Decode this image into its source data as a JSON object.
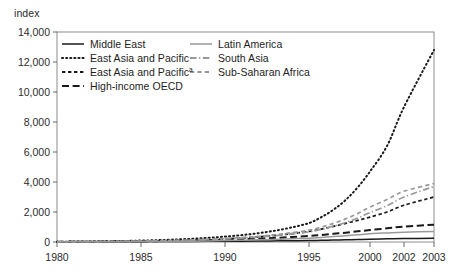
{
  "figure": {
    "background_color": "#ffffff",
    "frame_color": "#808080",
    "text_color": "#2b2b2b"
  },
  "axis": {
    "unit_label": "index"
  },
  "chart_data": {
    "type": "line",
    "title": "",
    "subtitle": "",
    "xlabel": "",
    "ylabel": "index",
    "xlim": [
      1980,
      2003
    ],
    "ylim": [
      0,
      14000
    ],
    "grid": false,
    "legend_position": "inside-top-left",
    "x_tick_labels": [
      "1980",
      "1985",
      "1990",
      "1995",
      "2000",
      "2002",
      "2003"
    ],
    "x_tick_values": [
      1980,
      1985,
      1990,
      1995,
      2000,
      2002,
      2003
    ],
    "y_tick_labels": [
      "0",
      "2,000",
      "4,000",
      "6,000",
      "8,000",
      "10,000",
      "12,000",
      "14,000"
    ],
    "y_tick_values": [
      0,
      2000,
      4000,
      6000,
      8000,
      10000,
      12000,
      14000
    ],
    "x": [
      1980,
      1981,
      1982,
      1983,
      1984,
      1985,
      1986,
      1987,
      1988,
      1989,
      1990,
      1991,
      1992,
      1993,
      1994,
      1995,
      1996,
      1997,
      1998,
      1999,
      2000,
      2001,
      2002,
      2003
    ],
    "series": [
      {
        "name": "Middle East",
        "style": "solid",
        "color": "#1a1a1a",
        "width": 1.5,
        "values": [
          10,
          12,
          14,
          17,
          20,
          24,
          28,
          33,
          38,
          44,
          50,
          58,
          66,
          76,
          86,
          98,
          112,
          128,
          146,
          166,
          190,
          210,
          230,
          250
        ]
      },
      {
        "name": "East Asia and Pacific",
        "style": "dotted",
        "color": "#1a1a1a",
        "width": 2.0,
        "values": [
          20,
          28,
          38,
          52,
          70,
          95,
          125,
          165,
          215,
          280,
          360,
          460,
          590,
          760,
          980,
          1260,
          1650,
          2150,
          2800,
          3650,
          4700,
          6400,
          9000,
          12800
        ]
      },
      {
        "name": "East Asia and Pacific",
        "name_suffix": "a",
        "style": "short-dash",
        "color": "#1a1a1a",
        "width": 1.7,
        "values": [
          15,
          20,
          26,
          34,
          45,
          58,
          75,
          98,
          126,
          162,
          208,
          268,
          345,
          440,
          560,
          700,
          860,
          1040,
          1240,
          1440,
          1660,
          2000,
          2450,
          3000
        ]
      },
      {
        "name": "High-income OECD",
        "style": "long-dash",
        "color": "#1a1a1a",
        "width": 2.0,
        "values": [
          12,
          16,
          21,
          27,
          35,
          45,
          58,
          74,
          94,
          118,
          148,
          184,
          226,
          276,
          334,
          400,
          470,
          545,
          625,
          710,
          800,
          910,
          1030,
          1150
        ]
      },
      {
        "name": "Latin America",
        "style": "solid",
        "color": "#999999",
        "width": 1.5,
        "values": [
          8,
          10,
          13,
          17,
          22,
          28,
          36,
          46,
          58,
          73,
          92,
          115,
          142,
          175,
          212,
          255,
          305,
          360,
          420,
          485,
          550,
          605,
          655,
          700
        ]
      },
      {
        "name": "South Asia",
        "style": "dash-dot",
        "color": "#999999",
        "width": 1.7,
        "values": [
          14,
          19,
          25,
          33,
          44,
          57,
          74,
          96,
          124,
          160,
          205,
          262,
          334,
          424,
          536,
          675,
          845,
          1050,
          1300,
          1600,
          1960,
          2420,
          3000,
          3700
        ]
      },
      {
        "name": "Sub-Saharan Africa",
        "style": "dashed",
        "color": "#999999",
        "width": 1.7,
        "values": [
          16,
          21,
          28,
          37,
          49,
          64,
          84,
          109,
          141,
          182,
          234,
          300,
          384,
          490,
          622,
          788,
          990,
          1240,
          1540,
          1900,
          2330,
          2830,
          3380,
          3900
        ]
      }
    ]
  },
  "legend": {
    "entries": [
      {
        "label": "Middle East",
        "suffix": "",
        "style": "solid",
        "color": "#1a1a1a",
        "column": 0,
        "row": 0
      },
      {
        "label": "East Asia and Pacific",
        "suffix": "",
        "style": "dotted",
        "color": "#1a1a1a",
        "column": 0,
        "row": 1
      },
      {
        "label": "East Asia and Pacific",
        "suffix": "a",
        "style": "short-dash",
        "color": "#1a1a1a",
        "column": 0,
        "row": 2
      },
      {
        "label": "High-income OECD",
        "suffix": "",
        "style": "long-dash",
        "color": "#1a1a1a",
        "column": 0,
        "row": 3
      },
      {
        "label": "Latin America",
        "suffix": "",
        "style": "solid",
        "color": "#999999",
        "column": 1,
        "row": 0
      },
      {
        "label": "South Asia",
        "suffix": "",
        "style": "dash-dot",
        "color": "#999999",
        "column": 1,
        "row": 1
      },
      {
        "label": "Sub-Saharan Africa",
        "suffix": "",
        "style": "dashed",
        "color": "#999999",
        "column": 1,
        "row": 2
      }
    ]
  }
}
